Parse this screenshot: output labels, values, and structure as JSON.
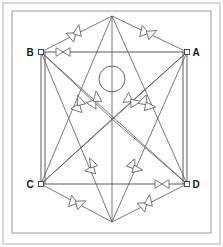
{
  "figure": {
    "width": 223,
    "height": 247,
    "background_color": "#ffffff",
    "line_color": "#55555c",
    "border_color": "#9a9aa0",
    "label_color": "#1a1a1a"
  },
  "border": {
    "outer": {
      "x": 3,
      "y": 3,
      "width": 217,
      "height": 241
    },
    "inner": {
      "x": 12,
      "y": 11,
      "width": 199,
      "height": 222
    }
  },
  "vertices": [
    {
      "id": "A",
      "label": "A",
      "x": 187,
      "y": 52,
      "label_x": 196,
      "label_y": 56,
      "has_node_marker": true
    },
    {
      "id": "B",
      "label": "B",
      "x": 41,
      "y": 52,
      "label_x": 30,
      "label_y": 56,
      "has_node_marker": true
    },
    {
      "id": "C",
      "label": "C",
      "x": 41,
      "y": 184,
      "label_x": 30,
      "label_y": 188,
      "has_node_marker": true
    },
    {
      "id": "D",
      "label": "D",
      "x": 187,
      "y": 184,
      "label_x": 196,
      "label_y": 188,
      "has_node_marker": true
    },
    {
      "id": "T",
      "label": "",
      "x": 112,
      "y": 16,
      "label_x": 112,
      "label_y": 16,
      "has_node_marker": false
    },
    {
      "id": "U",
      "label": "",
      "x": 112,
      "y": 222,
      "label_x": 112,
      "label_y": 222,
      "has_node_marker": false
    },
    {
      "id": "M",
      "label": "",
      "x": 112,
      "y": 119,
      "label_x": 112,
      "label_y": 119,
      "has_node_marker": false
    }
  ],
  "hub_circle": {
    "cx": 112,
    "cy": 79,
    "r": 13
  },
  "edges": [
    {
      "name": "edge-B-A",
      "x1": 41,
      "y1": 52,
      "x2": 187,
      "y2": 52,
      "style": "frame"
    },
    {
      "name": "edge-C-D",
      "x1": 41,
      "y1": 184,
      "x2": 187,
      "y2": 184,
      "style": "frame"
    },
    {
      "name": "edge-B-C",
      "x1": 41,
      "y1": 52,
      "x2": 41,
      "y2": 184,
      "style": "frame"
    },
    {
      "name": "edge-B-C-2",
      "x1": 45,
      "y1": 52,
      "x2": 45,
      "y2": 184,
      "style": "frame"
    },
    {
      "name": "edge-A-D",
      "x1": 187,
      "y1": 52,
      "x2": 187,
      "y2": 184,
      "style": "frame"
    },
    {
      "name": "edge-A-D-2",
      "x1": 183,
      "y1": 52,
      "x2": 183,
      "y2": 184,
      "style": "frame"
    },
    {
      "name": "edge-B-T",
      "x1": 41,
      "y1": 52,
      "x2": 112,
      "y2": 16,
      "style": "plain"
    },
    {
      "name": "edge-T-A",
      "x1": 112,
      "y1": 16,
      "x2": 187,
      "y2": 52,
      "style": "plain"
    },
    {
      "name": "edge-C-U",
      "x1": 41,
      "y1": 184,
      "x2": 112,
      "y2": 222,
      "style": "plain"
    },
    {
      "name": "edge-U-D",
      "x1": 112,
      "y1": 222,
      "x2": 187,
      "y2": 184,
      "style": "plain"
    },
    {
      "name": "edge-T-M",
      "x1": 112,
      "y1": 16,
      "x2": 112,
      "y2": 119,
      "style": "plain"
    },
    {
      "name": "edge-M-U",
      "x1": 112,
      "y1": 119,
      "x2": 112,
      "y2": 222,
      "style": "plain"
    },
    {
      "name": "edge-T-C",
      "x1": 112,
      "y1": 16,
      "x2": 41,
      "y2": 184,
      "style": "plain"
    },
    {
      "name": "edge-T-D",
      "x1": 112,
      "y1": 16,
      "x2": 187,
      "y2": 184,
      "style": "plain"
    },
    {
      "name": "edge-U-B",
      "x1": 112,
      "y1": 222,
      "x2": 41,
      "y2": 52,
      "style": "plain"
    },
    {
      "name": "edge-U-A",
      "x1": 112,
      "y1": 222,
      "x2": 187,
      "y2": 52,
      "style": "plain"
    },
    {
      "name": "edge-B-M",
      "x1": 41,
      "y1": 52,
      "x2": 112,
      "y2": 119,
      "style": "plain"
    },
    {
      "name": "edge-A-M",
      "x1": 187,
      "y1": 52,
      "x2": 112,
      "y2": 119,
      "style": "plain"
    },
    {
      "name": "edge-C-M",
      "x1": 41,
      "y1": 184,
      "x2": 112,
      "y2": 119,
      "style": "plain"
    },
    {
      "name": "edge-D-M",
      "x1": 187,
      "y1": 184,
      "x2": 112,
      "y2": 119,
      "style": "plain"
    },
    {
      "name": "edge-B-D",
      "x1": 41,
      "y1": 52,
      "x2": 187,
      "y2": 184,
      "style": "plain"
    },
    {
      "name": "edge-A-C",
      "x1": 187,
      "y1": 52,
      "x2": 41,
      "y2": 184,
      "style": "plain"
    }
  ],
  "markers": [
    {
      "name": "marker-bowtie-top-edge",
      "type": "bowtie",
      "x": 63,
      "y": 52,
      "angle": 0,
      "size": 7
    },
    {
      "name": "marker-bowtie-bottom-edge",
      "type": "bowtie",
      "x": 162,
      "y": 184,
      "angle": 0,
      "size": 7
    },
    {
      "name": "marker-arrowpair-upper-left",
      "type": "arrow-pair",
      "x": 75,
      "y": 34,
      "angle": -27,
      "size": 8
    },
    {
      "name": "marker-arrowpair-upper-right",
      "type": "arrow-pair",
      "x": 147,
      "y": 33,
      "angle": 26,
      "size": 8
    },
    {
      "name": "marker-arrowpair-lower-left",
      "type": "arrow-pair",
      "x": 76,
      "y": 203,
      "angle": 28,
      "size": 8
    },
    {
      "name": "marker-arrowpair-lower-right",
      "type": "arrow-pair",
      "x": 146,
      "y": 204,
      "angle": -27,
      "size": 8
    },
    {
      "name": "marker-arrowpair-mid-left-outer",
      "type": "arrow-pair",
      "x": 79,
      "y": 105,
      "angle": -58,
      "size": 8
    },
    {
      "name": "marker-arrowpair-mid-left-inner",
      "type": "arrow-pair",
      "x": 95,
      "y": 101,
      "angle": -43,
      "size": 8
    },
    {
      "name": "marker-arrowpair-mid-right-inner",
      "type": "arrow-pair",
      "x": 131,
      "y": 101,
      "angle": 43,
      "size": 8
    },
    {
      "name": "marker-arrowpair-mid-right-outer",
      "type": "arrow-pair",
      "x": 146,
      "y": 104,
      "angle": 58,
      "size": 8
    },
    {
      "name": "marker-arrow-lower-mid-left",
      "type": "arrow-single",
      "x": 92,
      "y": 167,
      "angle": -62,
      "size": 8
    },
    {
      "name": "marker-arrow-lower-mid-right",
      "type": "arrow-single",
      "x": 134,
      "y": 167,
      "angle": 62,
      "size": 8
    }
  ]
}
